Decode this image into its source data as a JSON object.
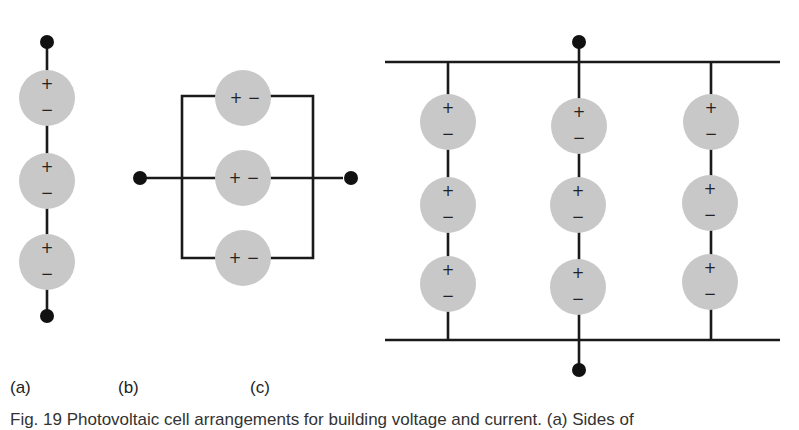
{
  "figure": {
    "panels": [
      {
        "label": "(a)",
        "arrangement": "series",
        "cells": 3
      },
      {
        "label": "(b)",
        "arrangement": "parallel",
        "cells": 3
      },
      {
        "label": "(c)",
        "arrangement": "series-parallel",
        "columns": 3,
        "cells_per_column": 3
      }
    ],
    "cell_polarity": {
      "positive": "+",
      "negative": "−"
    },
    "caption": "Fig. 19 Photovoltaic cell arrangements for building voltage and current. (a) Sides of",
    "colors": {
      "cell_fill": "#c8c8c8",
      "wire": "#1a1a1a",
      "terminal": "#111111"
    }
  }
}
